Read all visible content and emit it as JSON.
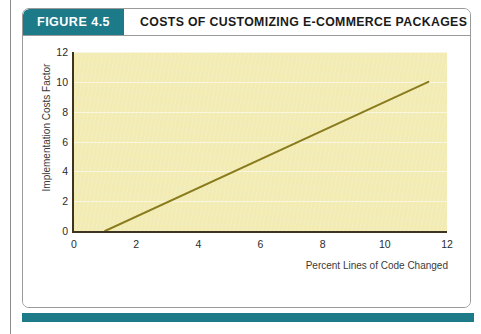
{
  "figure": {
    "badge_label": "FIGURE 4.5",
    "title": "COSTS OF CUSTOMIZING E-COMMERCE PACKAGES",
    "badge_color": "#1d7b89",
    "footer_rule_color": "#1d7b89",
    "border_color": "#9a9a9a",
    "caption_note": ""
  },
  "chart_data": {
    "type": "line",
    "title": "COSTS OF CUSTOMIZING E-COMMERCE PACKAGES",
    "xlabel": "Percent Lines of Code Changed",
    "ylabel": "Implementation Costs Factor",
    "xlim": [
      0,
      12
    ],
    "ylim": [
      0,
      12
    ],
    "xticks": [
      0,
      2,
      4,
      6,
      8,
      10,
      12
    ],
    "yticks": [
      0,
      2,
      4,
      6,
      8,
      10,
      12
    ],
    "grid": true,
    "grid_axis": "y",
    "legend": "none",
    "plot_background": "#f2ecb4",
    "axis_color": "#3d3520",
    "series": [
      {
        "name": "Implementation cost factor",
        "color": "#8a7b1e",
        "line_width": 2,
        "x": [
          1,
          11.4
        ],
        "y": [
          0,
          10
        ]
      }
    ]
  }
}
